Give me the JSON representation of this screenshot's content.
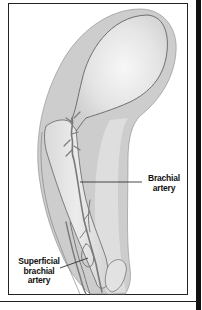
{
  "figure": {
    "type": "anatomical illustration",
    "labels": [
      {
        "id": "brachial",
        "lines": [
          "Brachial",
          "artery"
        ]
      },
      {
        "id": "superficial",
        "lines": [
          "Superficial",
          "brachial",
          "artery"
        ]
      }
    ]
  },
  "colors": {
    "soft_tissue": "#c8c8c8",
    "bone_highlight": "#f2f2f2",
    "bone": "#d6d6d6",
    "outline": "#555555",
    "artery": "#7a7a7a",
    "frame": "#222222"
  }
}
